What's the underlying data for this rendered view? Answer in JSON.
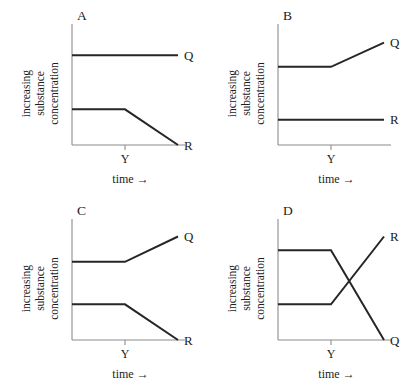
{
  "figure": {
    "background_color": "#ffffff",
    "line_color": "#26262a",
    "axis_color": "#8c8c8c",
    "text_color": "#1c1c1c"
  },
  "axis_titles": {
    "y_line1": "increasing",
    "y_line2": "substance",
    "y_line3": "concentration",
    "x_label": "time",
    "x_arrow": "→",
    "x_tick_label": "Y"
  },
  "chart_data": [
    {
      "type": "line",
      "title": "A",
      "xlabel": "time",
      "ylabel": "increasing substance concentration",
      "xlim": [
        0,
        100
      ],
      "ylim": [
        0,
        100
      ],
      "grid": false,
      "legend": "inline-right",
      "x_ticks": [
        {
          "value": 50,
          "label": "Y"
        }
      ],
      "series": [
        {
          "name": "Q",
          "label": "Q",
          "points": [
            {
              "x": 0,
              "y": 78
            },
            {
              "x": 100,
              "y": 78
            }
          ],
          "description": "constant, unchanged after Y"
        },
        {
          "name": "R",
          "label": "R",
          "points": [
            {
              "x": 0,
              "y": 31
            },
            {
              "x": 50,
              "y": 31
            },
            {
              "x": 100,
              "y": 0
            }
          ],
          "description": "constant until Y, then decreases to zero"
        }
      ]
    },
    {
      "type": "line",
      "title": "B",
      "xlabel": "time",
      "ylabel": "increasing substance concentration",
      "xlim": [
        0,
        100
      ],
      "ylim": [
        0,
        100
      ],
      "grid": false,
      "legend": "inline-right",
      "x_ticks": [
        {
          "value": 50,
          "label": "Y"
        }
      ],
      "series": [
        {
          "name": "Q",
          "label": "Q",
          "points": [
            {
              "x": 0,
              "y": 68
            },
            {
              "x": 50,
              "y": 68
            },
            {
              "x": 100,
              "y": 89
            }
          ],
          "description": "constant until Y, then increases"
        },
        {
          "name": "R",
          "label": "R",
          "points": [
            {
              "x": 0,
              "y": 22
            },
            {
              "x": 100,
              "y": 22
            }
          ],
          "description": "constant, unchanged after Y"
        }
      ]
    },
    {
      "type": "line",
      "title": "C",
      "xlabel": "time",
      "ylabel": "increasing substance concentration",
      "xlim": [
        0,
        100
      ],
      "ylim": [
        0,
        100
      ],
      "grid": false,
      "legend": "inline-right",
      "x_ticks": [
        {
          "value": 50,
          "label": "Y"
        }
      ],
      "series": [
        {
          "name": "Q",
          "label": "Q",
          "points": [
            {
              "x": 0,
              "y": 68
            },
            {
              "x": 50,
              "y": 68
            },
            {
              "x": 100,
              "y": 90
            }
          ],
          "description": "constant until Y, then increases"
        },
        {
          "name": "R",
          "label": "R",
          "points": [
            {
              "x": 0,
              "y": 31
            },
            {
              "x": 50,
              "y": 31
            },
            {
              "x": 100,
              "y": 0
            }
          ],
          "description": "constant until Y, then decreases to zero"
        }
      ]
    },
    {
      "type": "line",
      "title": "D",
      "xlabel": "time",
      "ylabel": "increasing substance concentration",
      "xlim": [
        0,
        100
      ],
      "ylim": [
        0,
        100
      ],
      "grid": false,
      "legend": "inline-right",
      "x_ticks": [
        {
          "value": 50,
          "label": "Y"
        }
      ],
      "series": [
        {
          "name": "Q",
          "label": "Q",
          "points": [
            {
              "x": 0,
              "y": 78
            },
            {
              "x": 50,
              "y": 78
            },
            {
              "x": 100,
              "y": 0
            }
          ],
          "description": "constant high until Y, then falls steeply to zero"
        },
        {
          "name": "R",
          "label": "R",
          "points": [
            {
              "x": 0,
              "y": 31
            },
            {
              "x": 50,
              "y": 31
            },
            {
              "x": 100,
              "y": 90
            }
          ],
          "description": "constant low until Y, then rises steeply"
        }
      ]
    }
  ]
}
